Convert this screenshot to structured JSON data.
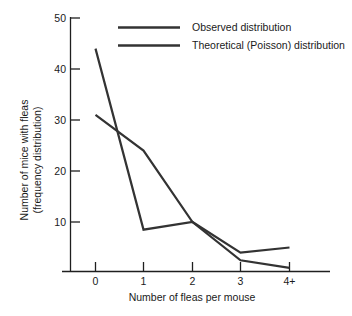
{
  "chart_data": {
    "type": "line",
    "title": "",
    "xlabel": "Number of fleas per mouse",
    "ylabel_line1": "Number of mice with fleas",
    "ylabel_line2": "(frequency distribution)",
    "categories": [
      "0",
      "1",
      "2",
      "3",
      "4+"
    ],
    "xtick_labels": [
      "0",
      "1",
      "2",
      "3",
      "4+"
    ],
    "ytick_labels": [
      "10",
      "20",
      "30",
      "40",
      "50"
    ],
    "yticks": [
      10,
      20,
      30,
      40,
      50
    ],
    "ylim": [
      0,
      50
    ],
    "grid": false,
    "legend_position": "top-center",
    "series": [
      {
        "name": "Observed distribution",
        "color": "#333333",
        "linewidth": 2.2,
        "values": [
          44,
          8.5,
          10,
          4,
          5
        ]
      },
      {
        "name": "Theoretical (Poisson) distribution",
        "color": "#333333",
        "linewidth": 2.2,
        "values": [
          31,
          24,
          10,
          2.5,
          1
        ]
      }
    ]
  },
  "legend": {
    "items": [
      {
        "label": "Observed distribution"
      },
      {
        "label": "Theoretical (Poisson) distribution"
      }
    ]
  },
  "axes": {
    "x_title": "Number of fleas per mouse",
    "y_title_line1": "Number of mice with fleas",
    "y_title_line2": "(frequency distribution)",
    "x_tick_0": "0",
    "x_tick_1": "1",
    "x_tick_2": "2",
    "x_tick_3": "3",
    "x_tick_4": "4+",
    "y_tick_10": "10",
    "y_tick_20": "20",
    "y_tick_30": "30",
    "y_tick_40": "40",
    "y_tick_50": "50"
  },
  "colors": {
    "ink": "#1f1f1f",
    "series": "#333333",
    "background": "#ffffff"
  }
}
